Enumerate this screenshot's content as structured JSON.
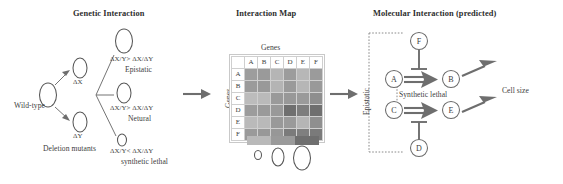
{
  "figure": {
    "panels": [
      {
        "id": "genetic_interaction",
        "title": "Genetic Interaction"
      },
      {
        "id": "interaction_map",
        "title": "Interaction Map"
      },
      {
        "id": "molecular_interaction",
        "title": "Molecular Interaction (predicted)"
      }
    ]
  },
  "genetic": {
    "wild_type": "Wild-type",
    "deletion_mutants": "Deletion mutants",
    "mutant_x": "ΔX",
    "mutant_y": "ΔY",
    "outcomes": [
      {
        "relation": "ΔX/Y> ΔX/ΔY",
        "name": "Epistatic"
      },
      {
        "relation": "ΔX/Y> ΔX/ΔY",
        "name": "Netural"
      },
      {
        "relation": "ΔX/Y< ΔX/ΔY",
        "name": "synthetic lethal"
      }
    ]
  },
  "map": {
    "axis_x_label": "Genes",
    "axis_y_label": "Genes",
    "col_headers": [
      "A",
      "B",
      "C",
      "D",
      "E",
      "F"
    ],
    "row_headers": [
      "A",
      "B",
      "C",
      "D",
      "E",
      "F"
    ],
    "legend_colors": [
      "#b9b9b9",
      "#9a9a9a",
      "#6f6f6f"
    ]
  },
  "chart_data": {
    "type": "heatmap",
    "title": "Interaction Map",
    "xlabel": "Genes",
    "ylabel": "Genes",
    "categories": [
      "A",
      "B",
      "C",
      "D",
      "E",
      "F"
    ],
    "x": [
      "A",
      "B",
      "C",
      "D",
      "E",
      "F"
    ],
    "y": [
      "A",
      "B",
      "C",
      "D",
      "E",
      "F"
    ],
    "grid": true,
    "legend_position": "below",
    "colorscale": [
      "#b9b9b9",
      "#9a9a9a",
      "#6f6f6f"
    ],
    "colorscale_meaning": [
      "small colony",
      "medium colony",
      "large colony"
    ],
    "values": [
      [
        "#9d9d9d",
        "#9a9a9a",
        "#b5b5b5",
        "#9c9c9c",
        "#b7b7b7",
        "#9b9b9b"
      ],
      [
        "#9b9b9b",
        "#999999",
        "#b4b4b4",
        "#9a9a9a",
        "#b6b6b6",
        "#999999"
      ],
      [
        "#bcbcbc",
        "#bababa",
        "#9a9a9a",
        "#989898",
        "#9a9a9a",
        "#8e8e8e"
      ],
      [
        "#9c9c9c",
        "#9a9a9a",
        "#999999",
        "#6f6f6f",
        "#7d7d7d",
        "#6f6f6f"
      ],
      [
        "#bababa",
        "#b9b9b9",
        "#999999",
        "#9a9a9a",
        "#b5b5b5",
        "#8f8f8f"
      ],
      [
        "#9a9a9a",
        "#989898",
        "#979797",
        "#7b7b7b",
        "#7f7f7f",
        "#7a7a7a"
      ]
    ]
  },
  "molecular": {
    "bracket_label": "Epistatic",
    "synthetic_lethal_label": "Synthetic lethal",
    "output_label": "Cell size",
    "nodes": [
      {
        "id": "F",
        "label": "F"
      },
      {
        "id": "A",
        "label": "A"
      },
      {
        "id": "B",
        "label": "B"
      },
      {
        "id": "C",
        "label": "C"
      },
      {
        "id": "E",
        "label": "E"
      },
      {
        "id": "D",
        "label": "D"
      }
    ],
    "edges": [
      {
        "from": "A",
        "to": "B",
        "type": "activation"
      },
      {
        "from": "C",
        "to": "E",
        "type": "activation"
      },
      {
        "from": "F",
        "to": "A-B",
        "type": "inhibition"
      },
      {
        "from": "D",
        "to": "C-E",
        "type": "inhibition"
      },
      {
        "from": "B",
        "to": "Cell size",
        "type": "activation"
      },
      {
        "from": "E",
        "to": "Cell size",
        "type": "activation"
      }
    ]
  }
}
